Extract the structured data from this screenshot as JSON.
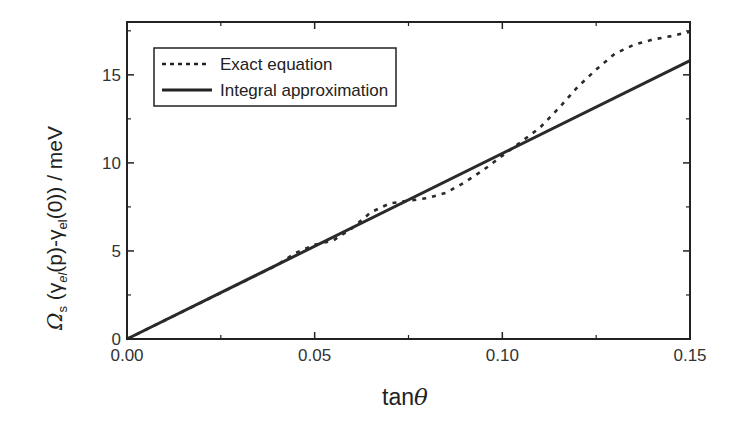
{
  "chart_data": {
    "type": "line",
    "title": "",
    "xlabel": "tanθ",
    "ylabel": "Ω_s (γ_el(p)-γ_el(0))  / meV",
    "xlim": [
      0,
      0.15
    ],
    "ylim": [
      0,
      18
    ],
    "x_ticks": [
      "0.00",
      "0.05",
      "0.10",
      "0.15"
    ],
    "y_ticks": [
      "0",
      "5",
      "10",
      "15"
    ],
    "grid": false,
    "legend_position": "upper left",
    "series": [
      {
        "name": "Exact equation",
        "style": "dashed",
        "x": [
          0.0,
          0.01,
          0.02,
          0.03,
          0.04,
          0.045,
          0.05,
          0.055,
          0.06,
          0.065,
          0.07,
          0.075,
          0.08,
          0.085,
          0.09,
          0.095,
          0.1,
          0.105,
          0.11,
          0.115,
          0.12,
          0.125,
          0.13,
          0.135,
          0.14,
          0.145,
          0.15
        ],
        "values": [
          0.0,
          1.05,
          2.1,
          3.15,
          4.2,
          4.9,
          5.35,
          5.6,
          6.3,
          7.2,
          7.7,
          7.85,
          8.0,
          8.3,
          8.9,
          9.6,
          10.4,
          11.2,
          12.0,
          13.1,
          14.3,
          15.3,
          16.2,
          16.7,
          17.0,
          17.2,
          17.45
        ]
      },
      {
        "name": "Integral approximation",
        "style": "solid",
        "x": [
          0.0,
          0.15
        ],
        "values": [
          0.0,
          15.8
        ]
      }
    ]
  },
  "axes": {
    "x_label_main": "tan",
    "x_label_symbol": "θ",
    "y_label_text": "Ω",
    "y_label_sub_s": "s",
    "y_label_mid": " (γ",
    "y_label_sub_el1": "el",
    "y_label_p": "(p)-γ",
    "y_label_sub_el2": "el",
    "y_label_end": "(0))  / meV"
  },
  "legend": {
    "items": [
      {
        "label": "Exact equation"
      },
      {
        "label": "Integral approximation"
      }
    ]
  }
}
